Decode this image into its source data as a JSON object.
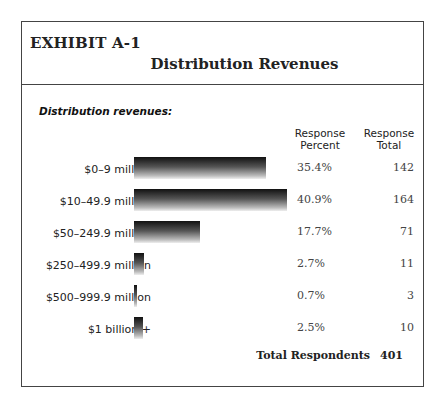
{
  "header": {
    "exhibit": "EXHIBIT A-1",
    "title": "Distribution Revenues"
  },
  "subhead": "Distribution revenues:",
  "columns": {
    "percent": "Response Percent",
    "total": "Response Total"
  },
  "rows": [
    {
      "label": "$0–9 million",
      "percent": "35.4%",
      "total": "142"
    },
    {
      "label": "$10–49.9 million",
      "percent": "40.9%",
      "total": "164"
    },
    {
      "label": "$50–249.9 million",
      "percent": "17.7%",
      "total": "71"
    },
    {
      "label": "$250–499.9 million",
      "percent": "2.7%",
      "total": "11"
    },
    {
      "label": "$500–999.9 million",
      "percent": "0.7%",
      "total": "3"
    },
    {
      "label": "$1 billion +",
      "percent": "2.5%",
      "total": "10"
    }
  ],
  "footer": {
    "label": "Total Respondents",
    "value": "401"
  },
  "chart_data": {
    "type": "bar",
    "orientation": "horizontal",
    "title": "Distribution Revenues",
    "subtitle": "Distribution revenues:",
    "categories": [
      "$0–9 million",
      "$10–49.9 million",
      "$50–249.9 million",
      "$250–499.9 million",
      "$500–999.9 million",
      "$1 billion +"
    ],
    "series": [
      {
        "name": "Response Percent",
        "values": [
          35.4,
          40.9,
          17.7,
          2.7,
          0.7,
          2.5
        ]
      },
      {
        "name": "Response Total",
        "values": [
          142,
          164,
          71,
          11,
          3,
          10
        ]
      }
    ],
    "total_respondents": 401,
    "xlabel": "",
    "ylabel": "",
    "grid": false,
    "legend": "none"
  }
}
